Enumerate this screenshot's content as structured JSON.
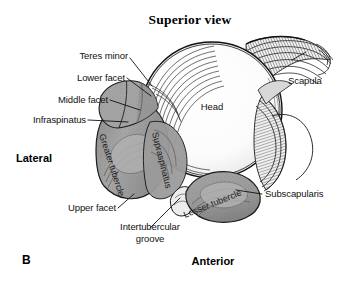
{
  "figure": {
    "title": "Superior view",
    "panel_letter": "B",
    "background_color": "#ffffff",
    "ink_color": "#111111",
    "bone_fill": "#ffffff",
    "tubercle_fill": "#9c9c9c",
    "facet_fill": "#a8a8a8",
    "shadow_fill": "#8a8a8a"
  },
  "orientation_labels": [
    {
      "name": "lateral",
      "text": "Lateral"
    },
    {
      "name": "anterior",
      "text": "Anterior"
    }
  ],
  "callouts": [
    {
      "id": "teres-minor",
      "text": "Teres minor"
    },
    {
      "id": "lower-facet",
      "text": "Lower facet"
    },
    {
      "id": "middle-facet",
      "text": "Middle facet"
    },
    {
      "id": "infraspinatus",
      "text": "Infraspinatus"
    },
    {
      "id": "upper-facet",
      "text": "Upper facet"
    },
    {
      "id": "intertubercular-groove-line1",
      "text": "Intertubercular"
    },
    {
      "id": "intertubercular-groove-line2",
      "text": "groove"
    },
    {
      "id": "head",
      "text": "Head"
    },
    {
      "id": "scapula",
      "text": "Scapula"
    },
    {
      "id": "subscapularis",
      "text": "Subscapularis"
    },
    {
      "id": "greater-tubercle",
      "text": "Greater tubercle"
    },
    {
      "id": "supraspinatus",
      "text": "Supraspinatus"
    },
    {
      "id": "lesser-tubercle",
      "text": "Lesser tubercle"
    }
  ]
}
